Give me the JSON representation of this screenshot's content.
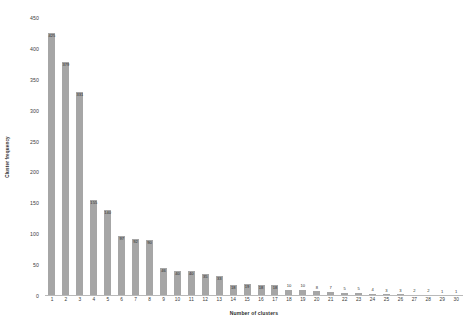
{
  "chart_data": {
    "type": "bar",
    "title": "",
    "xlabel": "Number of clusters",
    "ylabel": "Cluster frequency",
    "categories": [
      "1",
      "2",
      "3",
      "4",
      "5",
      "6",
      "7",
      "8",
      "9",
      "10",
      "11",
      "12",
      "13",
      "14",
      "15",
      "16",
      "17",
      "18",
      "19",
      "20",
      "21",
      "22",
      "23",
      "24",
      "25",
      "26",
      "27",
      "28",
      "29",
      "30"
    ],
    "values": [
      425,
      379,
      331,
      155,
      140,
      97,
      92,
      90,
      46,
      40,
      40,
      35,
      33,
      18,
      19,
      18,
      18,
      10,
      10,
      8,
      7,
      5,
      5,
      4,
      3,
      3,
      2,
      2,
      1,
      1
    ],
    "ylim": [
      0,
      450
    ],
    "yticks": [
      "0",
      "50",
      "100",
      "150",
      "200",
      "250",
      "300",
      "350",
      "400",
      "450"
    ],
    "ytick_values": [
      0,
      50,
      100,
      150,
      200,
      250,
      300,
      350,
      400,
      450
    ],
    "grid": false,
    "legend": false,
    "bar_color": "#a6a6a6",
    "axis_color": "#b9b9b9",
    "text_color": "#2d2d2d"
  }
}
